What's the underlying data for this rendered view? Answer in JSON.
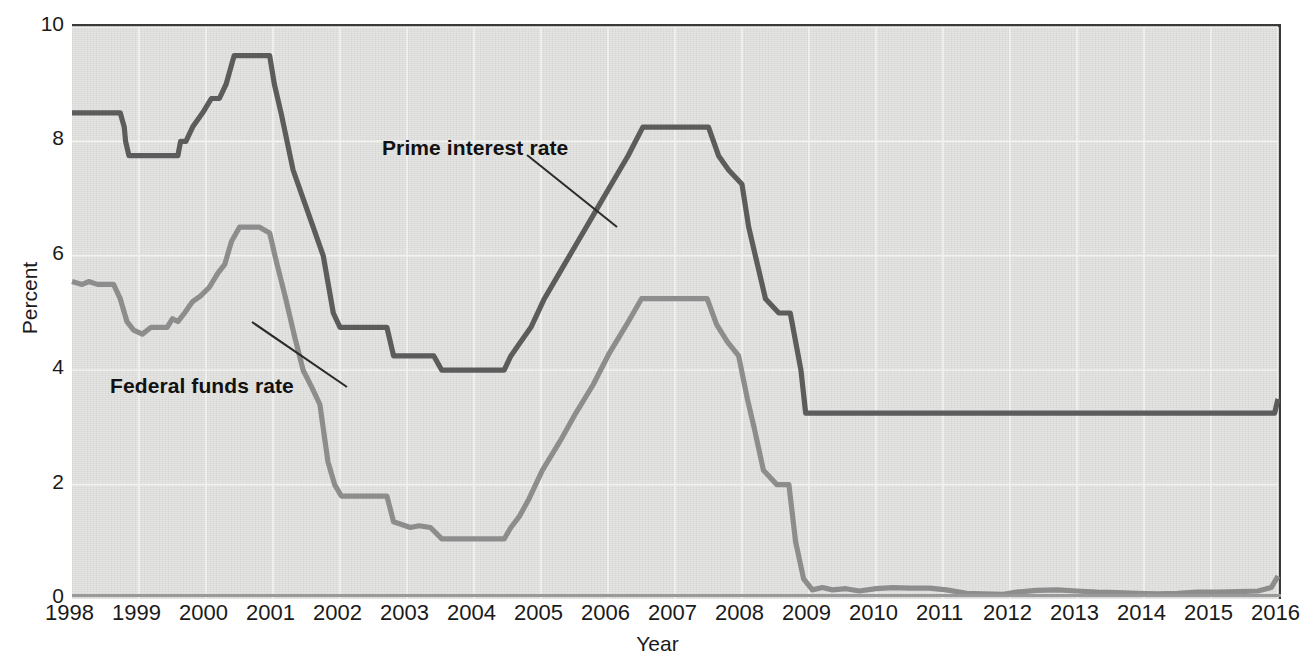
{
  "chart": {
    "type": "line",
    "title": "",
    "xlabel": "Year",
    "ylabel": "Percent",
    "plot_background": "#dededc",
    "grid": true,
    "legend_position": "inline-annotations"
  },
  "axes": {
    "y_ticks": [
      "10",
      "8",
      "6",
      "4",
      "2",
      "0"
    ],
    "y_tick_values": [
      10,
      8,
      6,
      4,
      2,
      0
    ],
    "ylim": [
      0,
      10
    ],
    "x_ticks": [
      "1998",
      "1999",
      "2000",
      "2001",
      "2002",
      "2003",
      "2004",
      "2005",
      "2006",
      "2007",
      "2008",
      "2009",
      "2010",
      "2011",
      "2012",
      "2013",
      "2014",
      "2015",
      "2016"
    ],
    "xlim": [
      1998,
      2016
    ]
  },
  "annotations": [
    {
      "name": "prime-interest-rate-label",
      "text": "Prime interest rate"
    },
    {
      "name": "federal-funds-rate-label",
      "text": "Federal funds rate"
    }
  ],
  "colors": {
    "prime_line": "#5c5c5c",
    "federal_funds_line": "#8d8d8d",
    "axis": "#3a3a3a",
    "gridline": "#f2f2f0",
    "text": "#1a1a1a"
  },
  "chart_data": {
    "type": "line",
    "title": "",
    "xlabel": "Year",
    "ylabel": "Percent",
    "xlim": [
      1998,
      2016
    ],
    "ylim": [
      0,
      10
    ],
    "grid": true,
    "legend_position": "inline-annotations",
    "x_tick_labels": [
      "1998",
      "1999",
      "2000",
      "2001",
      "2002",
      "2003",
      "2004",
      "2005",
      "2006",
      "2007",
      "2008",
      "2009",
      "2010",
      "2011",
      "2012",
      "2013",
      "2014",
      "2015",
      "2016"
    ],
    "y_tick_labels": [
      "0",
      "2",
      "4",
      "6",
      "8",
      "10"
    ],
    "series": [
      {
        "name": "Prime interest rate",
        "color": "#5c5c5c",
        "points": [
          [
            1998.0,
            8.5
          ],
          [
            1998.72,
            8.5
          ],
          [
            1998.78,
            8.25
          ],
          [
            1998.8,
            8.0
          ],
          [
            1998.85,
            7.75
          ],
          [
            1999.58,
            7.75
          ],
          [
            1999.62,
            8.0
          ],
          [
            1999.7,
            8.0
          ],
          [
            1999.8,
            8.25
          ],
          [
            1999.95,
            8.5
          ],
          [
            2000.08,
            8.75
          ],
          [
            2000.2,
            8.75
          ],
          [
            2000.3,
            9.0
          ],
          [
            2000.42,
            9.5
          ],
          [
            2000.58,
            9.5
          ],
          [
            2000.95,
            9.5
          ],
          [
            2001.02,
            9.0
          ],
          [
            2001.12,
            8.5
          ],
          [
            2001.3,
            7.5
          ],
          [
            2001.45,
            7.0
          ],
          [
            2001.6,
            6.5
          ],
          [
            2001.75,
            6.0
          ],
          [
            2001.9,
            5.0
          ],
          [
            2002.0,
            4.75
          ],
          [
            2002.7,
            4.75
          ],
          [
            2002.8,
            4.25
          ],
          [
            2003.4,
            4.25
          ],
          [
            2003.52,
            4.0
          ],
          [
            2004.45,
            4.0
          ],
          [
            2004.55,
            4.25
          ],
          [
            2004.7,
            4.5
          ],
          [
            2004.85,
            4.75
          ],
          [
            2005.05,
            5.25
          ],
          [
            2005.3,
            5.75
          ],
          [
            2005.55,
            6.25
          ],
          [
            2005.8,
            6.75
          ],
          [
            2006.05,
            7.25
          ],
          [
            2006.3,
            7.75
          ],
          [
            2006.52,
            8.25
          ],
          [
            2007.5,
            8.25
          ],
          [
            2007.65,
            7.75
          ],
          [
            2007.8,
            7.5
          ],
          [
            2008.0,
            7.25
          ],
          [
            2008.1,
            6.5
          ],
          [
            2008.2,
            6.0
          ],
          [
            2008.35,
            5.25
          ],
          [
            2008.55,
            5.0
          ],
          [
            2008.72,
            5.0
          ],
          [
            2008.8,
            4.5
          ],
          [
            2008.88,
            4.0
          ],
          [
            2008.95,
            3.25
          ],
          [
            2015.95,
            3.25
          ],
          [
            2016.0,
            3.5
          ]
        ]
      },
      {
        "name": "Federal funds rate",
        "color": "#8d8d8d",
        "points": [
          [
            1998.0,
            5.55
          ],
          [
            1998.15,
            5.5
          ],
          [
            1998.25,
            5.55
          ],
          [
            1998.38,
            5.5
          ],
          [
            1998.52,
            5.5
          ],
          [
            1998.62,
            5.5
          ],
          [
            1998.72,
            5.25
          ],
          [
            1998.82,
            4.85
          ],
          [
            1998.92,
            4.7
          ],
          [
            1999.05,
            4.63
          ],
          [
            1999.18,
            4.75
          ],
          [
            1999.3,
            4.75
          ],
          [
            1999.42,
            4.75
          ],
          [
            1999.5,
            4.9
          ],
          [
            1999.58,
            4.85
          ],
          [
            1999.68,
            5.0
          ],
          [
            1999.8,
            5.2
          ],
          [
            1999.92,
            5.3
          ],
          [
            2000.05,
            5.45
          ],
          [
            2000.18,
            5.7
          ],
          [
            2000.28,
            5.85
          ],
          [
            2000.38,
            6.25
          ],
          [
            2000.5,
            6.5
          ],
          [
            2000.62,
            6.5
          ],
          [
            2000.8,
            6.5
          ],
          [
            2000.95,
            6.4
          ],
          [
            2001.05,
            5.9
          ],
          [
            2001.18,
            5.3
          ],
          [
            2001.32,
            4.6
          ],
          [
            2001.45,
            4.0
          ],
          [
            2001.58,
            3.7
          ],
          [
            2001.7,
            3.4
          ],
          [
            2001.82,
            2.4
          ],
          [
            2001.92,
            2.0
          ],
          [
            2002.02,
            1.8
          ],
          [
            2002.7,
            1.8
          ],
          [
            2002.8,
            1.35
          ],
          [
            2003.05,
            1.25
          ],
          [
            2003.18,
            1.28
          ],
          [
            2003.35,
            1.25
          ],
          [
            2003.52,
            1.05
          ],
          [
            2004.45,
            1.05
          ],
          [
            2004.55,
            1.25
          ],
          [
            2004.68,
            1.45
          ],
          [
            2004.82,
            1.75
          ],
          [
            2005.02,
            2.25
          ],
          [
            2005.28,
            2.75
          ],
          [
            2005.52,
            3.25
          ],
          [
            2005.78,
            3.75
          ],
          [
            2006.02,
            4.3
          ],
          [
            2006.28,
            4.8
          ],
          [
            2006.5,
            5.25
          ],
          [
            2007.48,
            5.25
          ],
          [
            2007.62,
            4.8
          ],
          [
            2007.78,
            4.5
          ],
          [
            2007.95,
            4.25
          ],
          [
            2008.08,
            3.5
          ],
          [
            2008.18,
            3.0
          ],
          [
            2008.32,
            2.25
          ],
          [
            2008.52,
            2.0
          ],
          [
            2008.7,
            2.0
          ],
          [
            2008.8,
            1.0
          ],
          [
            2008.92,
            0.35
          ],
          [
            2009.05,
            0.16
          ],
          [
            2009.2,
            0.2
          ],
          [
            2009.35,
            0.16
          ],
          [
            2009.55,
            0.18
          ],
          [
            2009.75,
            0.14
          ],
          [
            2010.0,
            0.18
          ],
          [
            2010.25,
            0.2
          ],
          [
            2010.5,
            0.19
          ],
          [
            2010.8,
            0.19
          ],
          [
            2011.05,
            0.16
          ],
          [
            2011.35,
            0.1
          ],
          [
            2011.6,
            0.09
          ],
          [
            2011.9,
            0.08
          ],
          [
            2012.1,
            0.12
          ],
          [
            2012.4,
            0.15
          ],
          [
            2012.7,
            0.16
          ],
          [
            2013.0,
            0.14
          ],
          [
            2013.3,
            0.12
          ],
          [
            2013.6,
            0.11
          ],
          [
            2013.9,
            0.1
          ],
          [
            2014.2,
            0.09
          ],
          [
            2014.5,
            0.1
          ],
          [
            2014.8,
            0.12
          ],
          [
            2015.1,
            0.12
          ],
          [
            2015.4,
            0.13
          ],
          [
            2015.7,
            0.14
          ],
          [
            2015.9,
            0.2
          ],
          [
            2016.0,
            0.4
          ]
        ]
      }
    ]
  }
}
